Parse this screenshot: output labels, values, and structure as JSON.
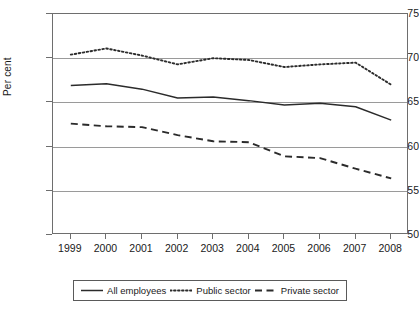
{
  "chart_data": {
    "type": "line",
    "title": "",
    "xlabel": "",
    "ylabel": "Per cent",
    "ylim": [
      50,
      75
    ],
    "yticks": [
      50,
      55,
      60,
      65,
      70,
      75
    ],
    "grid": true,
    "legend_position": "bottom",
    "categories": [
      "1999",
      "2000",
      "2001",
      "2002",
      "2003",
      "2004",
      "2005",
      "2006",
      "2007",
      "2008"
    ],
    "series": [
      {
        "name": "All employees",
        "style": "solid",
        "color": "#2b2b2b",
        "values": [
          66.9,
          67.1,
          66.5,
          65.5,
          65.6,
          65.2,
          64.7,
          64.9,
          64.5,
          63.0
        ]
      },
      {
        "name": "Public sector",
        "style": "dotted",
        "color": "#2b2b2b",
        "values": [
          70.4,
          71.1,
          70.3,
          69.3,
          70.0,
          69.8,
          69.0,
          69.3,
          69.5,
          67.0
        ]
      },
      {
        "name": "Private sector",
        "style": "dashed",
        "color": "#2b2b2b",
        "values": [
          62.6,
          62.3,
          62.2,
          61.3,
          60.6,
          60.5,
          58.9,
          58.7,
          57.5,
          56.4
        ]
      }
    ]
  },
  "axis": {
    "y_tick_labels": [
      "75",
      "70",
      "65",
      "60",
      "55",
      "50"
    ],
    "x_tick_labels": [
      "1999",
      "2000",
      "2001",
      "2002",
      "2003",
      "2004",
      "2005",
      "2006",
      "2007",
      "2008"
    ],
    "y_title": "Per cent"
  },
  "legend": {
    "items": [
      {
        "label": "All employees",
        "style": "solid"
      },
      {
        "label": "Public sector",
        "style": "dotted"
      },
      {
        "label": "Private sector",
        "style": "dashed"
      }
    ]
  }
}
